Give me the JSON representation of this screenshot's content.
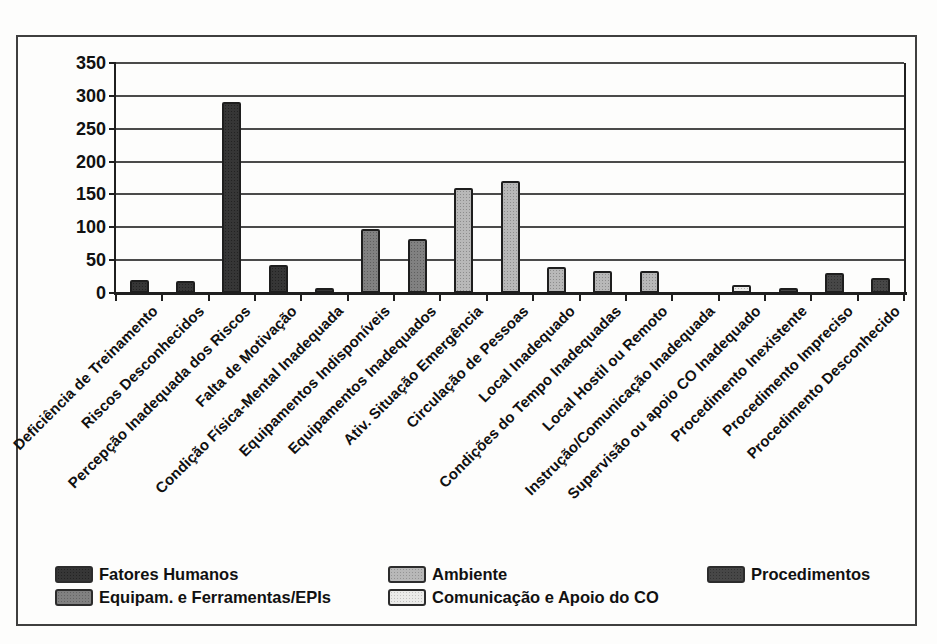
{
  "chart_data": {
    "type": "bar",
    "title": "",
    "xlabel": "",
    "ylabel": "",
    "ylim": [
      0,
      350
    ],
    "yticks": [
      0,
      50,
      100,
      150,
      200,
      250,
      300,
      350
    ],
    "grid": true,
    "legend_position": "bottom",
    "categories": [
      "Deficiência de Treinamento",
      "Riscos Desconhecidos",
      "Percepção Inadequada dos Riscos",
      "Falta de Motivação",
      "Condição Física-Mental Inadequada",
      "Equipamentos Indisponíveis",
      "Equipamentos Inadequados",
      "Ativ. Situação Emergência",
      "Circulação de Pessoas",
      "Local Inadequado",
      "Condições do Tempo Inadequadas",
      "Local Hostil ou Remoto",
      "Instrução/Comunicação Inadequada",
      "Supervisão ou apoio CO Inadequado",
      "Procedimento Inexistente",
      "Procedimento Impreciso",
      "Procedimento Desconhecido"
    ],
    "values": [
      20,
      18,
      290,
      43,
      7,
      98,
      82,
      160,
      170,
      40,
      33,
      33,
      0,
      12,
      7,
      30,
      23
    ],
    "bar_groups": [
      "Fatores Humanos",
      "Fatores Humanos",
      "Fatores Humanos",
      "Fatores Humanos",
      "Fatores Humanos",
      "Equipam. e Ferramentas/EPIs",
      "Equipam. e Ferramentas/EPIs",
      "Ambiente",
      "Ambiente",
      "Ambiente",
      "Ambiente",
      "Ambiente",
      "Comunicação e Apoio do CO",
      "Comunicação e Apoio do CO",
      "Procedimentos",
      "Procedimentos",
      "Procedimentos"
    ],
    "group_colors": {
      "Fatores Humanos": "#2b2b2b",
      "Equipam. e Ferramentas/EPIs": "#7a7a7a",
      "Ambiente": "#b4b4b4",
      "Comunicação e Apoio do CO": "#eaeae8",
      "Procedimentos": "#3d3d3d"
    }
  },
  "legend": {
    "columns": [
      [
        {
          "label": "Fatores Humanos",
          "color": "#2b2b2b"
        },
        {
          "label": "Equipam. e Ferramentas/EPIs",
          "color": "#7a7a7a"
        }
      ],
      [
        {
          "label": "Ambiente",
          "color": "#b4b4b4"
        },
        {
          "label": "Comunicação e Apoio do CO",
          "color": "#eaeae8"
        }
      ],
      [
        {
          "label": "Procedimentos",
          "color": "#3d3d3d"
        }
      ]
    ]
  },
  "colors": {
    "frame_border": "#3f3f3f",
    "gridline": "#4a4a4a",
    "axis": "#1f1f1f",
    "background": "#fdfdfc"
  }
}
